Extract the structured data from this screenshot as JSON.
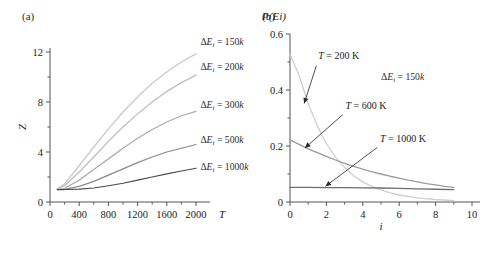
{
  "figure": {
    "panel_a_label": "(a)",
    "panel_b_label": "(b)"
  },
  "chart_data": [
    {
      "id": "panel-a",
      "type": "line",
      "title": "(a)",
      "xlabel": "T",
      "ylabel": "Z",
      "xlim": [
        0,
        2200
      ],
      "ylim": [
        0,
        13
      ],
      "xticks": [
        0,
        400,
        800,
        1200,
        1600,
        2000
      ],
      "xtick_labels": [
        "0",
        "400",
        "800",
        "1200",
        "1600",
        "2000"
      ],
      "yticks": [
        0,
        4,
        8,
        12
      ],
      "ytick_labels": [
        "0",
        "4",
        "8",
        "12"
      ],
      "minor_xticks": [
        200,
        600,
        1000,
        1400,
        1800
      ],
      "minor_yticks": [
        2,
        6,
        10
      ],
      "grid": false,
      "legend": "inline-curve-labels",
      "series": [
        {
          "name": "dE150",
          "label": "ΔEᵢ = 150k",
          "color": "#c9c9c9",
          "label_x": 2060,
          "label_y": 12.55,
          "x": [
            100,
            200,
            400,
            600,
            800,
            1000,
            1200,
            1400,
            1600,
            1800,
            2000
          ],
          "y": [
            1.05,
            1.45,
            2.9,
            4.4,
            5.85,
            7.2,
            8.4,
            9.5,
            10.4,
            11.2,
            11.85
          ]
        },
        {
          "name": "dE200",
          "label": "ΔEᵢ = 200k",
          "color": "#bdbdbd",
          "label_x": 2060,
          "label_y": 10.55,
          "x": [
            100,
            200,
            400,
            600,
            800,
            1000,
            1200,
            1400,
            1600,
            1800,
            2000
          ],
          "y": [
            1.02,
            1.3,
            2.4,
            3.6,
            4.85,
            6.0,
            7.05,
            8.0,
            8.85,
            9.55,
            10.15
          ]
        },
        {
          "name": "dE300",
          "label": "ΔEᵢ = 300k",
          "color": "#adadad",
          "label_x": 2060,
          "label_y": 7.5,
          "x": [
            100,
            200,
            400,
            600,
            800,
            1000,
            1200,
            1400,
            1600,
            1800,
            2000
          ],
          "y": [
            1.0,
            1.1,
            1.75,
            2.6,
            3.45,
            4.3,
            5.1,
            5.8,
            6.4,
            6.9,
            7.25
          ]
        },
        {
          "name": "dE500",
          "label": "ΔEᵢ = 500k",
          "color": "#8a8a8a",
          "label_x": 2060,
          "label_y": 4.75,
          "x": [
            100,
            200,
            400,
            600,
            800,
            1000,
            1200,
            1400,
            1600,
            1800,
            2000
          ],
          "y": [
            1.0,
            1.02,
            1.25,
            1.65,
            2.15,
            2.65,
            3.15,
            3.6,
            4.0,
            4.3,
            4.6
          ]
        },
        {
          "name": "dE1000",
          "label": "ΔEᵢ = 1000k",
          "color": "#4a4a4a",
          "label_x": 2060,
          "label_y": 2.6,
          "x": [
            100,
            200,
            400,
            600,
            800,
            1000,
            1200,
            1400,
            1600,
            1800,
            2000
          ],
          "y": [
            1.0,
            1.0,
            1.03,
            1.12,
            1.3,
            1.5,
            1.75,
            2.0,
            2.25,
            2.48,
            2.7
          ]
        }
      ]
    },
    {
      "id": "panel-b",
      "type": "line",
      "title": "(b)",
      "xlabel": "i",
      "ylabel": "P(Ei)",
      "xlim": [
        0,
        10
      ],
      "ylim": [
        0,
        0.6
      ],
      "xticks": [
        0,
        2,
        4,
        6,
        8,
        10
      ],
      "xtick_labels": [
        "0",
        "2",
        "4",
        "6",
        "8",
        "10"
      ],
      "yticks": [
        0,
        0.2,
        0.4,
        0.6
      ],
      "ytick_labels": [
        "0",
        "0.2",
        "0.4",
        "0.6"
      ],
      "minor_xticks": [
        1,
        3,
        5,
        7,
        9
      ],
      "minor_yticks": [
        0.1,
        0.3,
        0.5
      ],
      "grid": false,
      "annotation_delta": "ΔEᵢ = 150k",
      "annotation_delta_x": 5.0,
      "annotation_delta_y": 0.435,
      "series": [
        {
          "name": "T200",
          "label": "T = 200 K",
          "color": "#cfcfcf",
          "label_x": 1.55,
          "label_y": 0.512,
          "arrow_from": [
            1.45,
            0.487
          ],
          "arrow_to": [
            0.78,
            0.352
          ],
          "x": [
            0,
            0.5,
            1,
            1.5,
            2,
            2.5,
            3,
            3.5,
            4,
            4.5,
            5,
            5.5,
            6,
            7,
            8,
            9
          ],
          "y": [
            0.528,
            0.452,
            0.352,
            0.272,
            0.208,
            0.16,
            0.123,
            0.094,
            0.072,
            0.056,
            0.043,
            0.033,
            0.025,
            0.015,
            0.009,
            0.005
          ]
        },
        {
          "name": "T600",
          "label": "T = 600 K",
          "color": "#9b9b9b",
          "label_x": 3.05,
          "label_y": 0.333,
          "arrow_from": [
            2.9,
            0.312
          ],
          "arrow_to": [
            0.82,
            0.193
          ],
          "x": [
            0,
            0.5,
            1,
            1.5,
            2,
            2.5,
            3,
            3.5,
            4,
            4.5,
            5,
            5.5,
            6,
            6.5,
            7,
            7.5,
            8,
            8.5,
            9
          ],
          "y": [
            0.222,
            0.206,
            0.19,
            0.176,
            0.163,
            0.15,
            0.138,
            0.127,
            0.117,
            0.108,
            0.1,
            0.092,
            0.085,
            0.078,
            0.072,
            0.066,
            0.061,
            0.056,
            0.052
          ]
        },
        {
          "name": "T1000",
          "label": "T = 1000 K",
          "color": "#6f6f6f",
          "label_x": 4.95,
          "label_y": 0.213,
          "arrow_from": [
            4.8,
            0.195
          ],
          "arrow_to": [
            1.95,
            0.056
          ],
          "x": [
            0,
            1,
            2,
            3,
            4,
            5,
            6,
            7,
            8,
            9
          ],
          "y": [
            0.052,
            0.052,
            0.0515,
            0.051,
            0.0505,
            0.05,
            0.0485,
            0.047,
            0.0455,
            0.044
          ]
        }
      ]
    }
  ]
}
